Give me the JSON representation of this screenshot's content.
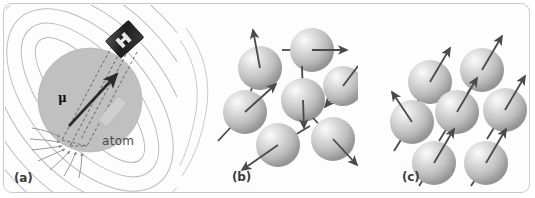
{
  "figure": {
    "background_color": "#ffffff",
    "frame_color": "#c9c9c9"
  },
  "panels": [
    {
      "id": "a",
      "label": "(a)",
      "caption_atom": "atom",
      "mu_symbol": "μ",
      "description": "Single atom drawn as a shaded sphere containing a small bar magnet; magnetic field lines loop around it and the magnetic moment vector mu points up and to the right.",
      "sphere": {
        "cx": 90,
        "cy": 100,
        "r": 52,
        "fill": "#bdbdbd"
      },
      "magnet_block": {
        "x": 112,
        "y": 28,
        "w": 26,
        "h": 20,
        "fill": "#2b2b2b"
      },
      "moment_arrow": {
        "x1": 70,
        "y1": 125,
        "x2": 117,
        "y2": 73,
        "color": "#2b2b2b"
      },
      "field_line_color": "#b8b8b8",
      "field_line_count": 10
    },
    {
      "id": "b",
      "label": "(b)",
      "description": "Seven atoms with magnetic moment arrows pointing in random directions (unmagnetized material).",
      "spheres": [
        {
          "cx": 260,
          "cy": 68,
          "r": 22,
          "angle_deg": -75
        },
        {
          "cx": 312,
          "cy": 50,
          "r": 22,
          "angle_deg": 0
        },
        {
          "cx": 340,
          "cy": 85,
          "r": 20,
          "angle_deg": -40
        },
        {
          "cx": 303,
          "cy": 100,
          "r": 22,
          "angle_deg": -88
        },
        {
          "cx": 245,
          "cy": 112,
          "r": 22,
          "angle_deg": -28
        },
        {
          "cx": 278,
          "cy": 145,
          "r": 22,
          "angle_deg": -25
        },
        {
          "cx": 332,
          "cy": 140,
          "r": 22,
          "angle_deg": -35
        }
      ]
    },
    {
      "id": "c",
      "label": "(c)",
      "description": "Seven atoms with magnetic moment arrows all aligned up and to the right (magnetized material).",
      "spheres": [
        {
          "cx": 430,
          "cy": 82,
          "r": 22,
          "angle_deg": -58
        },
        {
          "cx": 482,
          "cy": 70,
          "r": 22,
          "angle_deg": -58
        },
        {
          "cx": 412,
          "cy": 122,
          "r": 22,
          "angle_deg": -58
        },
        {
          "cx": 457,
          "cy": 112,
          "r": 22,
          "angle_deg": -58
        },
        {
          "cx": 503,
          "cy": 110,
          "r": 22,
          "angle_deg": -58
        },
        {
          "cx": 434,
          "cy": 163,
          "r": 22,
          "angle_deg": -58
        },
        {
          "cx": 486,
          "cy": 163,
          "r": 22,
          "angle_deg": -58
        }
      ]
    }
  ],
  "colors": {
    "sphere_light": "#f2f2f2",
    "sphere_mid": "#c4c4c4",
    "sphere_dark": "#8e8e8e",
    "arrow": "#4a4a4a",
    "label_text": "#3b3b3b",
    "atom_text": "#4a4a4a",
    "magnet_dark": "#2b2b2b",
    "sphere_a_fill": "#bdbdbd",
    "field_line": "#b8b8b8"
  }
}
